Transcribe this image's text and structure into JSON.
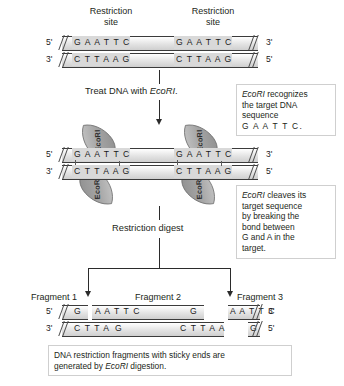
{
  "top_panel": {
    "site_label_left": "Restriction\nsite",
    "site_label_right": "Restriction\nsite",
    "site_label_line1": "Restriction",
    "site_label_line2": "site",
    "left_end_top": "5'",
    "left_end_bottom": "3'",
    "right_end_top": "3'",
    "right_end_bottom": "5'",
    "top_strand_site1": "G A A T T C",
    "top_strand_site2": "G A A T T C",
    "bottom_strand_site1": "C T T A A G",
    "bottom_strand_site2": "C T T A A G"
  },
  "step1": {
    "label_prefix": "Treat DNA with ",
    "label_enzyme": "EcoRI",
    "label_suffix": "."
  },
  "enzyme_panel": {
    "enzyme_name": "EcoRI",
    "enzymes": [
      {
        "position": "site1-top"
      },
      {
        "position": "site1-bottom"
      },
      {
        "position": "site2-top"
      },
      {
        "position": "site2-bottom"
      }
    ],
    "left_end_top": "5'",
    "left_end_bottom": "3'",
    "right_end_top": "3'",
    "right_end_bottom": "5'",
    "top_strand_site1": "G A A T T C",
    "top_strand_site2": "G A A T T C",
    "bottom_strand_site1": "C T T A A G",
    "bottom_strand_site2": "C T T A A G"
  },
  "step2": {
    "label": "Restriction digest"
  },
  "fragments": {
    "labels": [
      "Fragment 1",
      "Fragment 2",
      "Fragment 3"
    ],
    "left_end_top": "5'",
    "left_end_bottom": "3'",
    "right_end_top": "3'",
    "right_end_bottom": "5'",
    "frag1_top": "G",
    "frag1_bottom": "C T T A A",
    "frag2_top_left": "A A T T C",
    "frag2_top_right": "G",
    "frag2_bottom_left": "G",
    "frag2_bottom_right": "C T T A A",
    "frag3_top": "A A T T C",
    "frag3_bottom": "G"
  },
  "callouts": {
    "recognize": {
      "line1_italic": "EcoRI",
      "line1_rest": " recognizes",
      "line2": "the target DNA",
      "line3": "sequence",
      "line4": "G A A T T C."
    },
    "cleave": {
      "line1_italic": "EcoRI",
      "line1_rest": " cleaves its",
      "line2": "target sequence",
      "line3": "by breaking the",
      "line4": "bond between",
      "line5_a": "G",
      "line5_b": " and ",
      "line5_c": "A",
      "line5_d": " in the",
      "line6": "target."
    },
    "summary": {
      "line1": "DNA restriction fragments with sticky ends are",
      "line2_prefix": "generated by ",
      "line2_italic": "EcoRI",
      "line2_suffix": " digestion."
    }
  },
  "colors": {
    "text": "#231f20",
    "dna_fill": "#d9d9d9",
    "dna_line": "#3b3b3b",
    "enzyme_fill": "#a9a9a9",
    "arrow": "#2b2b2b",
    "callout_border": "#cfcfcf"
  }
}
